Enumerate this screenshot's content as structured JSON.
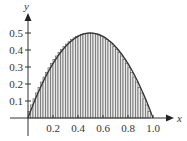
{
  "chart_data": {
    "type": "area",
    "title": "",
    "function": "y = 2x(1 - x)",
    "xlabel": "x",
    "ylabel": "y",
    "xlim": [
      0,
      1.0
    ],
    "ylim": [
      0,
      0.5
    ],
    "x_ticks": [
      "0.2",
      "0.4",
      "0.6",
      "0.8",
      "1.0"
    ],
    "y_ticks": [
      "0.1",
      "0.2",
      "0.3",
      "0.4",
      "0.5"
    ],
    "grid": false,
    "legend": null,
    "riemann_sum": {
      "rectangles": 50,
      "width": 0.02,
      "rule": "right-endpoint",
      "fill": "hatched vertical stripes"
    },
    "curve_points": {
      "x": [
        0,
        0.1,
        0.2,
        0.3,
        0.4,
        0.5,
        0.6,
        0.7,
        0.8,
        0.9,
        1.0
      ],
      "y": [
        0,
        0.18,
        0.32,
        0.42,
        0.48,
        0.5,
        0.48,
        0.42,
        0.32,
        0.18,
        0
      ]
    }
  },
  "axes": {
    "x_label": "x",
    "y_label": "y",
    "x_tick_labels": [
      "0.2",
      "0.4",
      "0.6",
      "0.8",
      "1.0"
    ],
    "y_tick_labels": [
      "0.1",
      "0.2",
      "0.3",
      "0.4",
      "0.5"
    ]
  },
  "colors": {
    "curve": "#333333",
    "bars_stroke": "#555555",
    "bars_fill": "#e6e6e6",
    "axes": "#333333"
  }
}
